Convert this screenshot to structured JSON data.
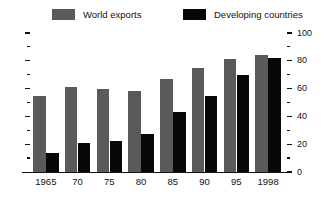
{
  "chart_data": {
    "type": "bar",
    "title": "",
    "subtitle": "",
    "xlabel": "",
    "ylabel": "",
    "categories": [
      "1965",
      "70",
      "75",
      "80",
      "85",
      "90",
      "95",
      "1998"
    ],
    "series": [
      {
        "name": "World exports",
        "color": "#5a5a5a",
        "values": [
          55,
          61,
          60,
          58,
          67,
          75,
          81,
          84
        ]
      },
      {
        "name": "Developing countries",
        "color": "#080808",
        "values": [
          14,
          21,
          22,
          27,
          43,
          55,
          70,
          82
        ]
      }
    ],
    "ylim": [
      0,
      100
    ],
    "y_axis_position": "right",
    "y_ticks_major": [
      0,
      20,
      40,
      60,
      80,
      100
    ],
    "y_ticks_major_labels": [
      "0",
      "20",
      "40",
      "60",
      "80",
      "100"
    ],
    "y_ticks_minor": [
      10,
      30,
      50,
      70,
      90
    ],
    "grid": false,
    "legend_position": "top"
  },
  "legend": {
    "entries": [
      {
        "label": "World exports",
        "color": "#5a5a5a"
      },
      {
        "label": "Developing countries",
        "color": "#080808"
      }
    ]
  },
  "axis": {
    "right_labels": [
      "100",
      "80",
      "60",
      "40",
      "20",
      "0"
    ],
    "x_labels": [
      "1965",
      "70",
      "75",
      "80",
      "85",
      "90",
      "95",
      "1998"
    ]
  }
}
